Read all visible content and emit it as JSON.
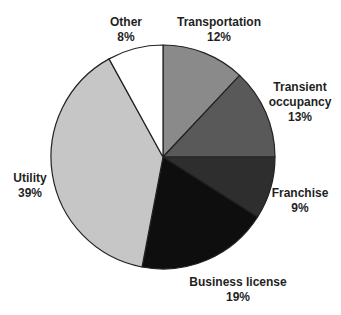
{
  "chart_data": {
    "type": "pie",
    "title": "",
    "legend": "none",
    "labels_position": "outside",
    "direction": "clockwise",
    "start_angle_deg": 0,
    "total": 100,
    "outline_color": "#222222",
    "background_color": "#ffffff",
    "text_color": "#1f1f1f",
    "slices": [
      {
        "label": "Transportation",
        "pct_label": "12%",
        "value": 12,
        "color": "#8a8a8a"
      },
      {
        "label": "Transient occupancy",
        "pct_label": "13%",
        "value": 13,
        "color": "#595959"
      },
      {
        "label": "Franchise",
        "pct_label": "9%",
        "value": 9,
        "color": "#2e2e2e"
      },
      {
        "label": "Business license",
        "pct_label": "19%",
        "value": 19,
        "color": "#0e0e0e"
      },
      {
        "label": "Utility",
        "pct_label": "39%",
        "value": 39,
        "color": "#c6c6c6"
      },
      {
        "label": "Other",
        "pct_label": "8%",
        "value": 8,
        "color": "#ffffff"
      }
    ]
  }
}
